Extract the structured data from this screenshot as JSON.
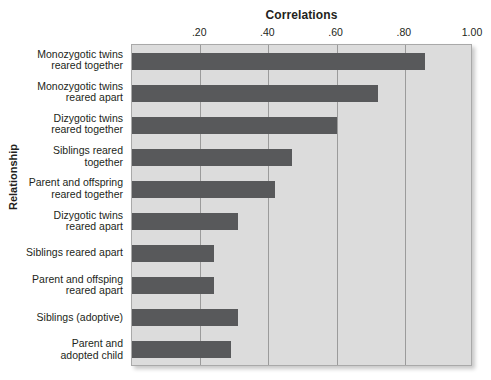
{
  "chart_data": {
    "type": "bar",
    "orientation": "horizontal",
    "title": "Correlations",
    "xlabel": "Correlations",
    "ylabel": "Relationship",
    "xlim": [
      0,
      1.0
    ],
    "xticks": [
      0.2,
      0.4,
      0.6,
      0.8,
      1.0
    ],
    "xtick_labels": [
      ".20",
      ".40",
      ".60",
      ".80",
      "1.00"
    ],
    "grid": true,
    "legend": "none",
    "bar_color": "#58595b",
    "plot_background": "#dcdcdc",
    "categories": [
      "Monozygotic twins\nreared together",
      "Monozygotic twins\nreared apart",
      "Dizygotic twins\nreared together",
      "Siblings reared\ntogether",
      "Parent and offspring\nreared together",
      "Dizygotic twins\nreared apart",
      "Siblings reared apart",
      "Parent and offsping\nreared apart",
      "Siblings (adoptive)",
      "Parent and\nadopted child"
    ],
    "values": [
      0.86,
      0.72,
      0.6,
      0.47,
      0.42,
      0.31,
      0.24,
      0.24,
      0.31,
      0.29
    ]
  }
}
